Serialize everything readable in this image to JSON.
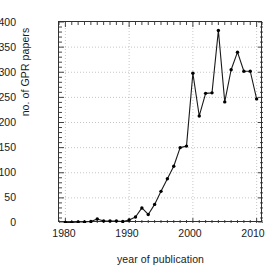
{
  "chart_data": {
    "type": "line",
    "title": "",
    "xlabel": "year of publication",
    "ylabel": "no. of GPR papers",
    "xlim": [
      1979,
      2011
    ],
    "ylim": [
      0,
      400
    ],
    "xticks": [
      1980,
      1990,
      2000,
      2010
    ],
    "yticks": [
      0,
      50,
      100,
      150,
      200,
      250,
      300,
      350,
      400
    ],
    "grid": true,
    "legend": null,
    "marker": "filled-circle",
    "line_color": "#1a1a1a",
    "x": [
      1980,
      1981,
      1982,
      1983,
      1984,
      1985,
      1986,
      1987,
      1988,
      1989,
      1990,
      1991,
      1992,
      1993,
      1994,
      1995,
      1996,
      1997,
      1998,
      1999,
      2000,
      2001,
      2002,
      2003,
      2004,
      2005,
      2006,
      2007,
      2008,
      2009,
      2010
    ],
    "values": [
      1,
      1,
      2,
      2,
      3,
      8,
      4,
      4,
      4,
      3,
      6,
      12,
      30,
      17,
      37,
      63,
      88,
      113,
      150,
      153,
      298,
      213,
      258,
      259,
      383,
      241,
      305,
      340,
      302,
      302,
      247
    ],
    "series": [
      {
        "name": "no. of GPR papers",
        "values": [
          1,
          1,
          2,
          2,
          3,
          8,
          4,
          4,
          4,
          3,
          6,
          12,
          30,
          17,
          37,
          63,
          88,
          113,
          150,
          153,
          298,
          213,
          258,
          259,
          383,
          241,
          305,
          340,
          302,
          302,
          247
        ]
      }
    ]
  },
  "axes": {
    "y_tick_labels": [
      "400",
      "350",
      "300",
      "250",
      "200",
      "150",
      "100",
      "50",
      "0"
    ],
    "x_tick_labels": [
      "1980",
      "1990",
      "2000",
      "2010"
    ],
    "y_title": "no. of GPR papers",
    "x_title": "year of publication"
  },
  "colors": {
    "line": "#1a1a1a",
    "marker": "#000000",
    "grid": "#b8b8b8",
    "frame": "#303030",
    "background": "#ffffff",
    "text": "#1a1a1a"
  }
}
